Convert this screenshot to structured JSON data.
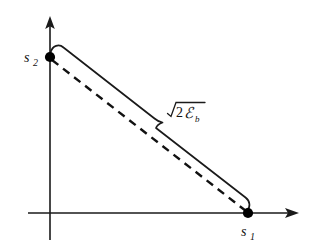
{
  "figure": {
    "background_color": "#ffffff",
    "stroke_color": "#1a1a1a"
  },
  "axes": {
    "x_axis": {
      "name": "horizontal-axis",
      "label": "s",
      "subscript": "1",
      "arrow": "right"
    },
    "y_axis": {
      "name": "vertical-axis",
      "label": "s",
      "subscript": "2",
      "arrow": "up"
    }
  },
  "points": [
    {
      "name": "s2-point",
      "label": "s",
      "subscript": "2",
      "location": "y-axis"
    },
    {
      "name": "s1-point",
      "label": "s",
      "subscript": "1",
      "location": "x-axis"
    }
  ],
  "annotation": {
    "name": "distance-brace",
    "radical_symbol": "√",
    "coefficient": "2",
    "symbol": "ℰ",
    "symbol_subscript": "b",
    "full_text": "√(2ℰb)"
  },
  "elements": {
    "dashed_segment": "dashed line connecting s2 on vertical axis to s1 on horizontal axis",
    "brace": "curly brace spanning the dashed segment indicating its length"
  }
}
